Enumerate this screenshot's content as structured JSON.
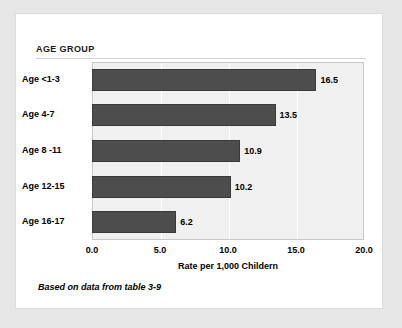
{
  "card": {
    "group_header": "AGE GROUP",
    "footnote": "Based on data from table 3-9"
  },
  "chart_data": {
    "type": "bar",
    "orientation": "horizontal",
    "title": "AGE GROUP",
    "xlabel": "Rate per 1,000 Childern",
    "ylabel": "",
    "categories": [
      "Age  <1-3",
      "Age   4-7",
      "Age  8 -11",
      "Age  12-15",
      "Age  16-17"
    ],
    "values": [
      16.5,
      13.5,
      10.9,
      10.2,
      6.2
    ],
    "value_labels": [
      "16.5",
      "13.5",
      "10.9",
      "10.2",
      "6.2"
    ],
    "xlim": [
      0.0,
      20.0
    ],
    "xticks": [
      0.0,
      5.0,
      10.0,
      15.0,
      20.0
    ],
    "xtick_labels": [
      "0.0",
      "5.0",
      "10.0",
      "15.0",
      "20.0"
    ],
    "grid": true,
    "legend": false,
    "annotation": "Based on data from table 3-9",
    "bar_color": "#4d4d4d",
    "plot_background": "#f0f0f0"
  }
}
